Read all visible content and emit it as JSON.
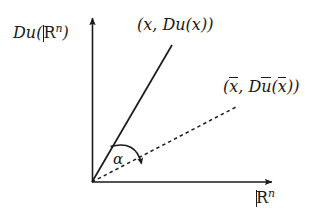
{
  "figure": {
    "background_color": "#ffffff",
    "stroke_color": "#1a1a1a",
    "width": 328,
    "height": 218
  },
  "axes": {
    "origin": {
      "x": 92,
      "y": 182
    },
    "vertical": {
      "label": "Du(ℝⁿ)",
      "label_parts": {
        "prefix": "Du(",
        "symbol": "R",
        "superscript": "n",
        "suffix": ")"
      },
      "tip": {
        "x": 93,
        "y": 13
      }
    },
    "horizontal": {
      "label": "ℝⁿ",
      "label_parts": {
        "symbol": "R",
        "superscript": "n"
      },
      "tip": {
        "x": 278,
        "y": 182
      }
    }
  },
  "rays": {
    "solid": {
      "label": "(x, Du(x))",
      "label_parts": {
        "open": "(",
        "arg": "x",
        "comma": ",",
        "fn": "Du(",
        "fn_arg": "x",
        "fn_close": ")",
        "close": ")"
      },
      "style": "solid",
      "end": {
        "x": 172,
        "y": 45
      },
      "angle_degrees": 62
    },
    "dashed": {
      "label": "(x̄, Dū(x̄))",
      "label_parts": {
        "open": "(",
        "arg": "x",
        "comma": ",",
        "fn_d": "D",
        "fn_u": "u",
        "fn_open": "(",
        "fn_arg": "x",
        "fn_close": ")",
        "close": ")"
      },
      "style": "dashed",
      "end": {
        "x": 235,
        "y": 108
      },
      "angle_degrees": 27
    }
  },
  "angle_marker": {
    "label": "α",
    "description": "curved arrow from solid ray to dashed ray",
    "radius": 40
  }
}
